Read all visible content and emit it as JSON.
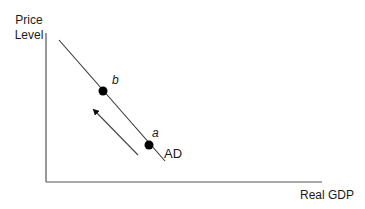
{
  "diagram": {
    "title": "",
    "y_axis_label_line1": "Price",
    "y_axis_label_line2": "Level",
    "x_axis_label": "Real GDP",
    "curve": {
      "name": "AD",
      "description": "Aggregate demand curve, downward sloping"
    },
    "points": [
      {
        "label": "a",
        "description": "lower point on AD"
      },
      {
        "label": "b",
        "description": "higher point on AD"
      }
    ],
    "arrow": {
      "direction": "up-left along AD",
      "meaning": "movement along AD from a to b"
    },
    "colors": {
      "line": "#333333",
      "point": "#000000",
      "axis": "#555555",
      "text": "#1a1a1a",
      "background": "#ffffff"
    }
  }
}
